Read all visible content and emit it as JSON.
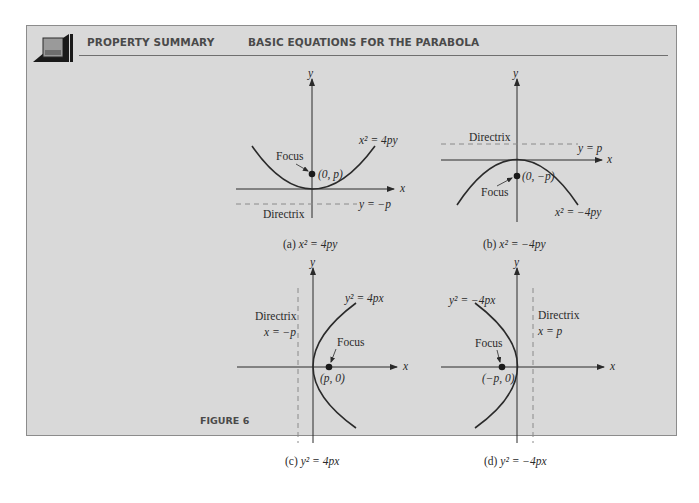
{
  "header": {
    "section": "PROPERTY SUMMARY",
    "title": "BASIC EQUATIONS FOR THE PARABOLA",
    "icon": "book-icon"
  },
  "figure_label": "FIGURE 6",
  "colors": {
    "panel_bg": "#d9d9d9",
    "panel_border": "#8c8c8c",
    "ink": "#2a2a2a",
    "dashed": "#8a8a8a",
    "header_text": "#4a4a4a"
  },
  "diagrams": [
    {
      "id": "a",
      "caption_prefix": "(a) ",
      "caption_eq": "x² = 4py",
      "equation": "x² = 4py",
      "focus_label": "Focus",
      "focus_point": "(0, p)",
      "directrix_label": "Directrix",
      "directrix_eq": "y = −p",
      "x_axis": "x",
      "y_axis": "y",
      "opens": "up"
    },
    {
      "id": "b",
      "caption_prefix": "(b) ",
      "caption_eq": "x² = −4py",
      "equation": "x² = −4py",
      "focus_label": "Focus",
      "focus_point": "(0, −p)",
      "directrix_label": "Directrix",
      "directrix_eq": "y = p",
      "x_axis": "x",
      "y_axis": "y",
      "opens": "down"
    },
    {
      "id": "c",
      "caption_prefix": "(c) ",
      "caption_eq": "y² = 4px",
      "equation": "y² = 4px",
      "focus_label": "Focus",
      "focus_point": "(p, 0)",
      "directrix_label": "Directrix",
      "directrix_eq": "x = −p",
      "x_axis": "x",
      "y_axis": "y",
      "opens": "right"
    },
    {
      "id": "d",
      "caption_prefix": "(d) ",
      "caption_eq": "y² = −4px",
      "equation": "y² = −4px",
      "focus_label": "Focus",
      "focus_point": "(−p, 0)",
      "directrix_label": "Directrix",
      "directrix_eq": "x = p",
      "x_axis": "x",
      "y_axis": "y",
      "opens": "left"
    }
  ]
}
